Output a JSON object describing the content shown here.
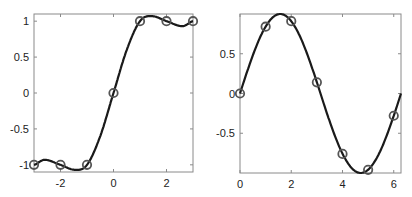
{
  "chart_data": [
    {
      "type": "line",
      "title": "",
      "xlabel": "",
      "ylabel": "",
      "xlim": [
        -3,
        3
      ],
      "ylim": [
        -1.1,
        1.1
      ],
      "xticks": [
        -2,
        0,
        2
      ],
      "xtick_labels": [
        "-2",
        "0",
        "2"
      ],
      "yticks": [
        -1,
        -0.5,
        0,
        0.5,
        1
      ],
      "ytick_labels": [
        "-1",
        "-0.5",
        "0",
        "0.5",
        "1"
      ],
      "grid": false,
      "series": [
        {
          "name": "samples",
          "style": "circle-markers",
          "x": [
            -3,
            -2,
            -1,
            0,
            1,
            2,
            3
          ],
          "values": [
            -1,
            -1,
            -1,
            0,
            1,
            1,
            1
          ]
        },
        {
          "name": "interpolant",
          "style": "solid-line",
          "x": [
            -3,
            -2.6,
            -2,
            -1.45,
            -1,
            -0.5,
            0,
            0.5,
            1,
            1.45,
            2,
            2.6,
            3
          ],
          "values": [
            -1,
            -0.93,
            -1,
            -1.07,
            -1,
            -0.6,
            0,
            0.6,
            1,
            1.07,
            1,
            0.93,
            1
          ]
        }
      ]
    },
    {
      "type": "line",
      "title": "",
      "xlabel": "",
      "ylabel": "",
      "xlim": [
        0,
        6.283
      ],
      "ylim": [
        -1,
        1
      ],
      "xticks": [
        0,
        2,
        4,
        6
      ],
      "xtick_labels": [
        "0",
        "2",
        "4",
        "6"
      ],
      "yticks": [
        -0.5,
        0,
        0.5
      ],
      "ytick_labels": [
        "-0.5",
        "0",
        "0.5"
      ],
      "grid": false,
      "series": [
        {
          "name": "samples",
          "style": "circle-markers",
          "x": [
            0,
            1,
            2,
            3,
            4,
            5,
            6
          ],
          "values": [
            0,
            0.84,
            0.91,
            0.14,
            -0.76,
            -0.96,
            -0.28
          ]
        },
        {
          "name": "sin(x)",
          "style": "solid-line",
          "x_range": [
            0,
            6.283
          ],
          "function": "sin"
        }
      ]
    }
  ]
}
